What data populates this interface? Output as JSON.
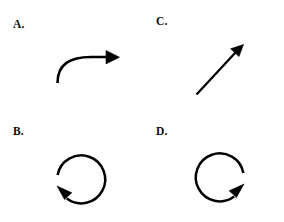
{
  "figure": {
    "type": "multiple-choice-arrow-diagram",
    "background_color": "#ffffff",
    "stroke_color": "#000000",
    "width": 284,
    "height": 222,
    "options": [
      {
        "key": "A",
        "label": "A.",
        "icon_name": "curved-arrow-right-icon",
        "description": "Curved arrow bending from lower-left upward then turning right, arrowhead pointing right",
        "direction": "right",
        "shape": "curved",
        "label_position": {
          "x": 13,
          "y": 19
        }
      },
      {
        "key": "C",
        "label": "C.",
        "icon_name": "diagonal-arrow-up-right-icon",
        "description": "Straight diagonal arrow pointing up and to the right",
        "direction": "up-right",
        "shape": "straight",
        "label_position": {
          "x": 156,
          "y": 16
        }
      },
      {
        "key": "B",
        "label": "B.",
        "icon_name": "circular-arrow-clockwise-icon",
        "description": "Circular arrow with gap at left, arrowhead at lower-left pointing up-left",
        "direction": "clockwise",
        "shape": "circle",
        "label_position": {
          "x": 13,
          "y": 126
        }
      },
      {
        "key": "D",
        "label": "D.",
        "icon_name": "circular-arrow-counterclockwise-icon",
        "description": "Circular arrow with gap at right, arrowhead at lower-right pointing up-right",
        "direction": "counterclockwise",
        "shape": "circle",
        "label_position": {
          "x": 156,
          "y": 126
        }
      }
    ]
  }
}
